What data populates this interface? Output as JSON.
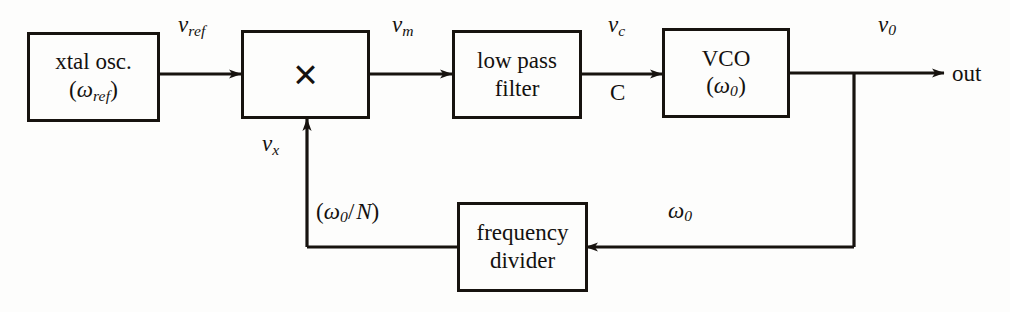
{
  "diagram": {
    "type": "block-diagram",
    "background_color": "#fdfdfc",
    "line_color": "#17130f"
  },
  "blocks": {
    "xtal_osc": {
      "line1": "xtal osc.",
      "line2_open": "(",
      "line2_sym": "ω",
      "line2_sub": "ref",
      "line2_close": ")"
    },
    "multiplier": {
      "glyph": "×",
      "name": "multiplier"
    },
    "low_pass_filter": {
      "line1": "low pass",
      "line2": "filter"
    },
    "vco": {
      "line1": "VCO",
      "line2_open": "(",
      "line2_sym": "ω",
      "line2_sub": "0",
      "line2_close": ")"
    },
    "frequency_divider": {
      "line1": "frequency",
      "line2": "divider"
    }
  },
  "labels": {
    "v_ref": {
      "sym": "v",
      "sub": "ref"
    },
    "v_m": {
      "sym": "v",
      "sub": "m"
    },
    "v_c": {
      "sym": "v",
      "sub": "c"
    },
    "v_0": {
      "sym": "v",
      "sub": "0"
    },
    "v_x": {
      "sym": "v",
      "sub": "x"
    },
    "node_c": "C",
    "out": "out",
    "omega_0_feedback": {
      "sym": "ω",
      "sub": "0"
    },
    "omega_0_over_n": {
      "open": "(",
      "sym": "ω",
      "sub": "0",
      "slash": "/",
      "divisor": "N",
      "close": ")"
    }
  }
}
